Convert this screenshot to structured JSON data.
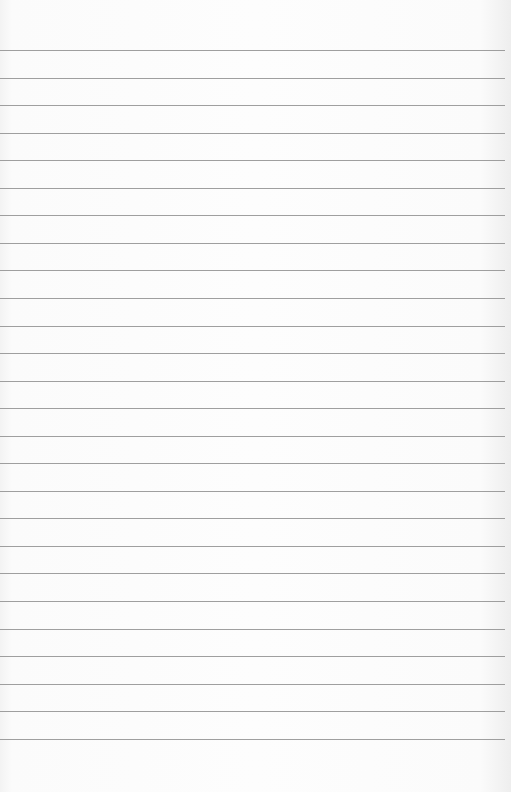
{
  "document": {
    "type": "lined-paper",
    "line_count": 26,
    "first_line_y": 50,
    "line_spacing": 27.55,
    "line_width": 505,
    "colors": {
      "paper": "#fdfdfd",
      "rule": "#8e8e8e"
    }
  }
}
